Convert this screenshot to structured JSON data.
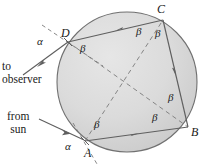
{
  "figure": {
    "name": "raindrop-refraction-diagram",
    "colors": {
      "dropFill": "#d6d6d6",
      "dropStroke": "#6e6e6e",
      "ray": "#6a6a6a",
      "dashed": "#6a6a6a",
      "text": "#1a1a1a",
      "background": "#ffffff"
    },
    "drop": {
      "cx": 127,
      "cy": 82,
      "r": 70
    },
    "points": {
      "A": {
        "label": "A",
        "x": 85,
        "y": 141
      },
      "B": {
        "label": "B",
        "x": 188,
        "y": 127
      },
      "C": {
        "label": "C",
        "x": 163,
        "y": 20
      },
      "D": {
        "label": "D",
        "x": 68,
        "y": 42
      }
    },
    "angle_labels": [
      {
        "id": "alpha-D",
        "text": "α",
        "x": 42,
        "y": 41
      },
      {
        "id": "beta-D",
        "text": "β",
        "x": 84,
        "y": 48
      },
      {
        "id": "beta-C-left",
        "text": "β",
        "x": 140,
        "y": 31
      },
      {
        "id": "beta-C-right",
        "text": "β",
        "x": 159,
        "y": 33
      },
      {
        "id": "beta-B-upper",
        "text": "β",
        "x": 172,
        "y": 97
      },
      {
        "id": "beta-B-lower",
        "text": "β",
        "x": 156,
        "y": 117
      },
      {
        "id": "beta-A",
        "text": "β",
        "x": 98,
        "y": 124
      },
      {
        "id": "alpha-A",
        "text": "α",
        "x": 69,
        "y": 146
      }
    ],
    "ray_labels": [
      {
        "id": "to-observer",
        "line1": "to",
        "line2": "observer",
        "x": 2,
        "y": 66
      },
      {
        "id": "from-sun",
        "line1": "from",
        "line2": "sun",
        "x": 9,
        "y": 117
      }
    ],
    "rays": {
      "incident": {
        "from": "sun",
        "to": "A"
      },
      "refracted_A_to_B": {
        "from": "A",
        "to": "B"
      },
      "reflected_B_to_C": {
        "from": "B",
        "to": "C"
      },
      "reflected_C_to_D": {
        "from": "C",
        "to": "D"
      },
      "exit_D_to_observer": {
        "from": "D",
        "to": "observer"
      }
    },
    "chords_dashed": [
      {
        "from": "D",
        "to": "B"
      },
      {
        "from": "A",
        "to": "C"
      }
    ],
    "normals_dashed": [
      {
        "at": "D"
      },
      {
        "at": "A"
      }
    ]
  }
}
